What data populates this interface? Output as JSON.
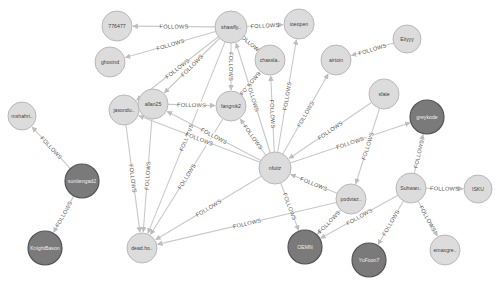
{
  "graph": {
    "relationship_label": "FOLLOWS",
    "colors": {
      "background": "#ffffff",
      "edge": "#c9c9c9",
      "node_light_fill": "#dcdcdc",
      "node_dark_fill": "#7a7a7a",
      "label_text": "#555555"
    },
    "nodes": [
      {
        "id": "n776477",
        "label": "776477",
        "x": 117,
        "y": 26,
        "r": 15,
        "style": "light"
      },
      {
        "id": "ghoxind",
        "label": "ghoxind",
        "x": 110,
        "y": 62,
        "r": 15,
        "style": "light"
      },
      {
        "id": "shawfly",
        "label": "shawfly..",
        "x": 231,
        "y": 27,
        "r": 16,
        "style": "light"
      },
      {
        "id": "ioeopen",
        "label": "ioeopen",
        "x": 299,
        "y": 24,
        "r": 15,
        "style": "light"
      },
      {
        "id": "chassla",
        "label": "chassla..",
        "x": 270,
        "y": 60,
        "r": 15,
        "style": "light"
      },
      {
        "id": "airtoin",
        "label": "airtoin",
        "x": 336,
        "y": 60,
        "r": 15,
        "style": "light"
      },
      {
        "id": "eiiyyy",
        "label": "Eiiyyy",
        "x": 407,
        "y": 39,
        "r": 14,
        "style": "light"
      },
      {
        "id": "mshahri",
        "label": "mshahri..",
        "x": 22,
        "y": 116,
        "r": 14,
        "style": "light"
      },
      {
        "id": "jasondu",
        "label": "jasondu..",
        "x": 124,
        "y": 110,
        "r": 15,
        "style": "light"
      },
      {
        "id": "allan25",
        "label": "allan25",
        "x": 153,
        "y": 104,
        "r": 15,
        "style": "light"
      },
      {
        "id": "fangmk2",
        "label": "fangmk2",
        "x": 231,
        "y": 106,
        "r": 15,
        "style": "light"
      },
      {
        "id": "nfuitz",
        "label": "nfuitz",
        "x": 275,
        "y": 168,
        "r": 16,
        "style": "light"
      },
      {
        "id": "sfate",
        "label": "sfate",
        "x": 384,
        "y": 94,
        "r": 15,
        "style": "light"
      },
      {
        "id": "greykode",
        "label": "greykode",
        "x": 427,
        "y": 117,
        "r": 17,
        "style": "dark"
      },
      {
        "id": "suntiengad2",
        "label": "suntiengad2",
        "x": 82,
        "y": 181,
        "r": 17,
        "style": "dark"
      },
      {
        "id": "podviaz",
        "label": "podviaz..",
        "x": 351,
        "y": 199,
        "r": 15,
        "style": "light"
      },
      {
        "id": "suhwan",
        "label": "Suhwan..",
        "x": 411,
        "y": 188,
        "r": 15,
        "style": "light"
      },
      {
        "id": "isku",
        "label": "ISKU",
        "x": 478,
        "y": 189,
        "r": 14,
        "style": "light"
      },
      {
        "id": "knightbason",
        "label": "KnightBason",
        "x": 45,
        "y": 248,
        "r": 17,
        "style": "dark"
      },
      {
        "id": "deadho",
        "label": "dead.ho..",
        "x": 142,
        "y": 248,
        "r": 15,
        "style": "light"
      },
      {
        "id": "oemn",
        "label": "OEMN",
        "x": 305,
        "y": 247,
        "r": 17,
        "style": "dark"
      },
      {
        "id": "yufoon7",
        "label": "YuFoon7",
        "x": 369,
        "y": 260,
        "r": 17,
        "style": "dark"
      },
      {
        "id": "emaxgre",
        "label": "emaxgre..",
        "x": 445,
        "y": 250,
        "r": 15,
        "style": "light"
      }
    ],
    "edges": [
      {
        "from": "shawfly",
        "to": "n776477",
        "label": "FOLLOWS"
      },
      {
        "from": "shawfly",
        "to": "ghoxind",
        "label": "FOLLOWS"
      },
      {
        "from": "shawfly",
        "to": "ioeopen",
        "label": "FOLLOWS"
      },
      {
        "from": "shawfly",
        "to": "chassla",
        "label": "FOLLOWS"
      },
      {
        "from": "shawfly",
        "to": "jasondu",
        "label": "FOLLOWS"
      },
      {
        "from": "shawfly",
        "to": "allan25",
        "label": "FOLLOWS"
      },
      {
        "from": "shawfly",
        "to": "fangmk2",
        "label": "FOLLOWS"
      },
      {
        "from": "shawfly",
        "to": "deadho",
        "label": "FOLLOWS"
      },
      {
        "from": "eiiyyy",
        "to": "airtoin",
        "label": "FOLLOWS"
      },
      {
        "from": "allan25",
        "to": "fangmk2",
        "label": "FOLLOWS"
      },
      {
        "from": "allan25",
        "to": "deadho",
        "label": "FOLLOWS"
      },
      {
        "from": "fangmk2",
        "to": "chassla",
        "label": "FOLLOWS"
      },
      {
        "from": "fangmk2",
        "to": "deadho",
        "label": "FOLLOWS"
      },
      {
        "from": "jasondu",
        "to": "deadho",
        "label": "FOLLOWS"
      },
      {
        "from": "nfuitz",
        "to": "jasondu",
        "label": "FOLLOWS"
      },
      {
        "from": "nfuitz",
        "to": "allan25",
        "label": "FOLLOWS"
      },
      {
        "from": "nfuitz",
        "to": "fangmk2",
        "label": "FOLLOWS"
      },
      {
        "from": "nfuitz",
        "to": "shawfly",
        "label": "FOLLOWS"
      },
      {
        "from": "nfuitz",
        "to": "chassla",
        "label": "FOLLOWS"
      },
      {
        "from": "nfuitz",
        "to": "ioeopen",
        "label": "FOLLOWS"
      },
      {
        "from": "nfuitz",
        "to": "airtoin",
        "label": "FOLLOWS"
      },
      {
        "from": "nfuitz",
        "to": "greykode",
        "label": "FOLLOWS"
      },
      {
        "from": "nfuitz",
        "to": "deadho",
        "label": "FOLLOWS"
      },
      {
        "from": "nfuitz",
        "to": "oemn",
        "label": "FOLLOWS"
      },
      {
        "from": "sfate",
        "to": "nfuitz",
        "label": "FOLLOWS"
      },
      {
        "from": "sfate",
        "to": "podviaz",
        "label": "FOLLOWS"
      },
      {
        "from": "podviaz",
        "to": "nfuitz",
        "label": "FOLLOWS"
      },
      {
        "from": "podviaz",
        "to": "deadho",
        "label": "FOLLOWS"
      },
      {
        "from": "podviaz",
        "to": "oemn",
        "label": "FOLLOWS"
      },
      {
        "from": "suhwan",
        "to": "greykode",
        "label": "FOLLOWS"
      },
      {
        "from": "suhwan",
        "to": "isku",
        "label": "FOLLOWS"
      },
      {
        "from": "suhwan",
        "to": "oemn",
        "label": "FOLLOWS"
      },
      {
        "from": "suhwan",
        "to": "yufoon7",
        "label": "FOLLOWS"
      },
      {
        "from": "suhwan",
        "to": "emaxgre",
        "label": "FOLLOWS"
      },
      {
        "from": "suntiengad2",
        "to": "mshahri",
        "label": "FOLLOWS"
      },
      {
        "from": "suntiengad2",
        "to": "knightbason",
        "label": "FOLLOWS"
      }
    ]
  }
}
